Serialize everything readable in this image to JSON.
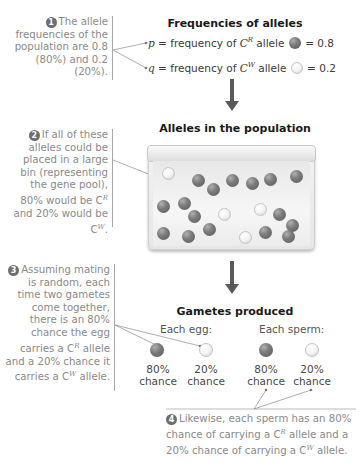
{
  "notes": {
    "n1": {
      "badge": "1",
      "text": "The allele frequencies of the population are 0.8 (80%) and 0.2 (20%)."
    },
    "n2": {
      "badge": "2",
      "text_pre": "If all of these alleles could be placed in a large bin (representing the gene pool), 80% would be C",
      "sup1": "R",
      "text_mid": " and 20% would be C",
      "sup2": "W",
      "text_end": "."
    },
    "n3": {
      "badge": "3",
      "text_pre": "Assuming mating is random, each time two gametes come together, there is an 80% chance the egg carries a C",
      "sup1": "R",
      "text_mid": " allele and a 20% chance it carries a C",
      "sup2": "W",
      "text_end": " allele."
    },
    "n4": {
      "badge": "4",
      "text_pre": "Likewise, each sperm has an 80% chance of carrying a C",
      "sup1": "R",
      "text_mid": " allele and a 20% chance of carrying a C",
      "sup2": "W",
      "text_end": " allele."
    }
  },
  "frequencies": {
    "title": "Frequencies of alleles",
    "p": {
      "symbol": "p",
      "label": " = frequency of ",
      "allele": "C",
      "sup": "R",
      "suffix": " allele",
      "value": "= 0.8",
      "color": "gray"
    },
    "q": {
      "symbol": "q",
      "label": " = frequency of ",
      "allele": "C",
      "sup": "W",
      "suffix": " allele",
      "value": "= 0.2",
      "color": "white"
    }
  },
  "population": {
    "title": "Alleles in the population",
    "counts": {
      "CR": 16,
      "CW": 4
    }
  },
  "gametes": {
    "title": "Gametes produced",
    "egg": {
      "label": "Each egg:",
      "options": [
        {
          "pct": "80%",
          "word": "chance"
        },
        {
          "pct": "20%",
          "word": "chance"
        }
      ]
    },
    "sperm": {
      "label": "Each sperm:",
      "options": [
        {
          "pct": "80%",
          "word": "chance"
        },
        {
          "pct": "20%",
          "word": "chance"
        }
      ]
    }
  },
  "colors": {
    "CR": "#6e6e6e",
    "CW": "#f6f6f6",
    "note_text": "#8a8a8a",
    "arrow": "#5a5a5a"
  }
}
